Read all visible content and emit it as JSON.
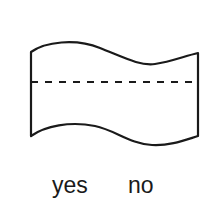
{
  "diagram": {
    "shape": "punched-tape-flag",
    "stroke_color": "#1a1a1a",
    "fill_color": "#ffffff",
    "divider": "dashed"
  },
  "labels": {
    "yes": "yes",
    "no": "no"
  }
}
